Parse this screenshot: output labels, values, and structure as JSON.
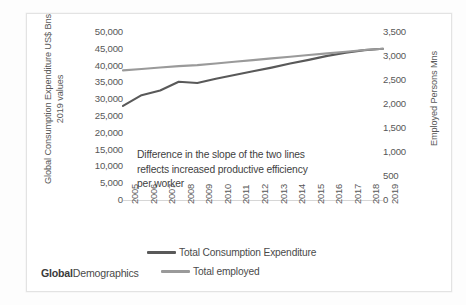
{
  "brand": {
    "bold_part": "Global",
    "light_part": "Demographics"
  },
  "top_artifact": "",
  "annotation": {
    "line1": "Difference in the slope of the two lines",
    "line2": "reflects increased productive efficiency",
    "line3": "per worker"
  },
  "legend": {
    "items": [
      {
        "label": "Total Consumption Expenditure",
        "color": "#595959"
      },
      {
        "label": "Total employed",
        "color": "#9a9a9a"
      }
    ]
  },
  "chart_data": {
    "type": "line",
    "title": "",
    "xlabel": "",
    "ylabel": "Global Consumption Expenditure US$ Bns 2019 values",
    "y2label": "Employed Persons Mns",
    "grid": false,
    "legend_position": "bottom",
    "categories": [
      "2005",
      "2006",
      "2007",
      "2008",
      "2009",
      "2010",
      "2011",
      "2012",
      "2013",
      "2014",
      "2015",
      "2016",
      "2017",
      "2018",
      "2019"
    ],
    "ylim": [
      0,
      50000
    ],
    "yticks": [
      "50,000",
      "45,000",
      "40,000",
      "35,000",
      "30,000",
      "25,000",
      "20,000",
      "15,000",
      "10,000",
      "5,000",
      "0"
    ],
    "ytick_values": [
      50000,
      45000,
      40000,
      35000,
      30000,
      25000,
      20000,
      15000,
      10000,
      5000,
      0
    ],
    "y2lim": [
      0,
      3500
    ],
    "y2ticks": [
      "3,500",
      "3,000",
      "2,500",
      "2,000",
      "1,500",
      "1,000",
      "500",
      "0"
    ],
    "y2tick_values": [
      3500,
      3000,
      2500,
      2000,
      1500,
      1000,
      500,
      0
    ],
    "series": [
      {
        "name": "Total Consumption Expenditure",
        "axis": "left",
        "color": "#595959",
        "units": "US$ Bns (2019 values)",
        "values": [
          28000,
          31200,
          32600,
          35200,
          34800,
          36100,
          37200,
          38300,
          39400,
          40600,
          41700,
          42900,
          43800,
          44600,
          45000
        ]
      },
      {
        "name": "Total employed",
        "axis": "right",
        "color": "#9a9a9a",
        "units": "Mns persons",
        "values": [
          2700,
          2730,
          2760,
          2790,
          2810,
          2845,
          2880,
          2915,
          2950,
          2985,
          3020,
          3055,
          3090,
          3125,
          3150
        ]
      }
    ]
  }
}
